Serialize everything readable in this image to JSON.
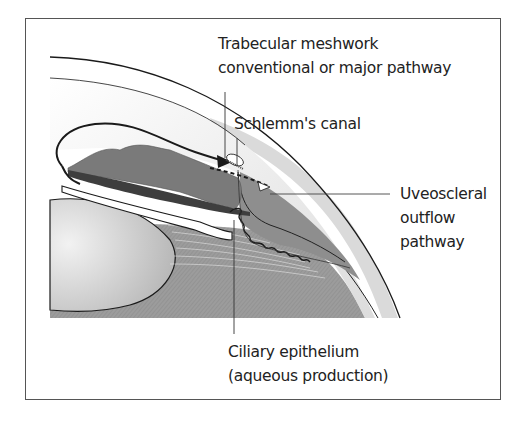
{
  "figure": {
    "labels": {
      "trabecular": [
        "Trabecular meshwork",
        "conventional or major pathway"
      ],
      "schlemm": [
        "Schlemm's canal"
      ],
      "uveoscleral": [
        "Uveoscleral",
        "outflow",
        "pathway"
      ],
      "ciliary": [
        "Ciliary epithelium",
        "(aqueous production)"
      ]
    },
    "colors": {
      "frame": "#555555",
      "cornea": "#e6e6e6",
      "sclera": "#d0d0d0",
      "iris": "#7a7a7a",
      "ciliary_body": "#8f8f8f",
      "lens": "#c8c8c8",
      "vitreous": "#9a9a9a",
      "ink": "#1a1a1a"
    }
  }
}
